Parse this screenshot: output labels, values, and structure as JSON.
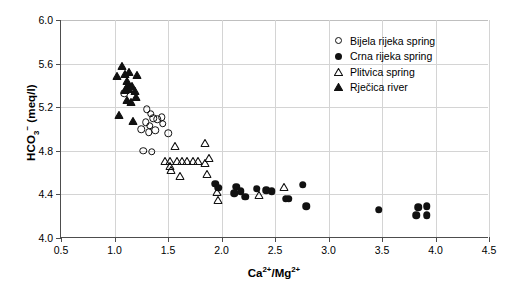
{
  "chart_data": {
    "type": "scatter",
    "title": "",
    "xlabel": "Ca2+/Mg2+",
    "ylabel": "HCO3- (meq/l)",
    "xlim": [
      0.5,
      4.5
    ],
    "ylim": [
      4.0,
      6.0
    ],
    "xticks": [
      "0.5",
      "1.0",
      "1.5",
      "2.0",
      "2.5",
      "3.0",
      "3.5",
      "4.0",
      "4.5"
    ],
    "xtick_values": [
      0.5,
      1.0,
      1.5,
      2.0,
      2.5,
      3.0,
      3.5,
      4.0,
      4.5
    ],
    "yticks": [
      "4.0",
      "4.4",
      "4.8",
      "5.2",
      "5.6",
      "6.0"
    ],
    "ytick_values": [
      4.0,
      4.4,
      4.8,
      5.2,
      5.6,
      6.0
    ],
    "grid": true,
    "legend_position": "top-right",
    "series": [
      {
        "name": "Bijela rijeka spring",
        "marker": "circle-open",
        "color": "#111111",
        "points": [
          [
            1.09,
            5.33
          ],
          [
            1.3,
            5.18
          ],
          [
            1.34,
            5.14
          ],
          [
            1.36,
            5.1
          ],
          [
            1.29,
            5.06
          ],
          [
            1.33,
            5.03
          ],
          [
            1.4,
            5.09
          ],
          [
            1.44,
            5.11
          ],
          [
            1.45,
            5.05
          ],
          [
            1.38,
            4.99
          ],
          [
            1.32,
            4.97
          ],
          [
            1.25,
            5.0
          ],
          [
            1.27,
            4.8
          ],
          [
            1.35,
            4.79
          ],
          [
            1.5,
            4.96
          ]
        ]
      },
      {
        "name": "Crna rijeka spring",
        "marker": "circle-filled",
        "color": "#111111",
        "points": [
          [
            1.94,
            4.5
          ],
          [
            1.97,
            4.46
          ],
          [
            2.14,
            4.47
          ],
          [
            2.12,
            4.41
          ],
          [
            2.18,
            4.43
          ],
          [
            2.22,
            4.38
          ],
          [
            2.33,
            4.45
          ],
          [
            2.42,
            4.44
          ],
          [
            2.47,
            4.43
          ],
          [
            2.6,
            4.36
          ],
          [
            2.63,
            4.36
          ],
          [
            2.76,
            4.49
          ],
          [
            2.79,
            4.29
          ],
          [
            3.47,
            4.26
          ],
          [
            3.84,
            4.28
          ],
          [
            3.82,
            4.21
          ],
          [
            3.92,
            4.29
          ],
          [
            3.92,
            4.21
          ]
        ]
      },
      {
        "name": "Plitvica spring",
        "marker": "triangle-open",
        "color": "#111111",
        "points": [
          [
            1.57,
            4.9
          ],
          [
            1.47,
            4.76
          ],
          [
            1.52,
            4.76
          ],
          [
            1.52,
            4.72
          ],
          [
            1.53,
            4.68
          ],
          [
            1.58,
            4.76
          ],
          [
            1.63,
            4.76
          ],
          [
            1.68,
            4.76
          ],
          [
            1.73,
            4.76
          ],
          [
            1.78,
            4.76
          ],
          [
            1.61,
            4.62
          ],
          [
            1.85,
            4.93
          ],
          [
            1.88,
            4.79
          ],
          [
            1.85,
            4.74
          ],
          [
            1.86,
            4.64
          ],
          [
            1.96,
            4.48
          ],
          [
            1.97,
            4.4
          ],
          [
            2.35,
            4.45
          ],
          [
            2.58,
            4.52
          ]
        ]
      },
      {
        "name": "Rječica river",
        "marker": "triangle-filled",
        "color": "#111111",
        "points": [
          [
            1.07,
            5.63
          ],
          [
            1.02,
            5.54
          ],
          [
            1.1,
            5.56
          ],
          [
            1.14,
            5.58
          ],
          [
            1.21,
            5.55
          ],
          [
            1.12,
            5.5
          ],
          [
            1.13,
            5.46
          ],
          [
            1.12,
            5.43
          ],
          [
            1.14,
            5.42
          ],
          [
            1.16,
            5.45
          ],
          [
            1.1,
            5.41
          ],
          [
            1.19,
            5.4
          ],
          [
            1.2,
            5.35
          ],
          [
            1.15,
            5.3
          ],
          [
            1.12,
            5.32
          ],
          [
            1.04,
            5.18
          ],
          [
            1.17,
            5.13
          ]
        ]
      }
    ]
  },
  "legend": {
    "items": [
      {
        "label": "Bijela rijeka spring",
        "marker": "circle-open"
      },
      {
        "label": "Crna rijeka spring",
        "marker": "circle-filled"
      },
      {
        "label": "Plitvica spring",
        "marker": "triangle-open"
      },
      {
        "label": "Rječica river",
        "marker": "triangle-filled"
      }
    ]
  }
}
